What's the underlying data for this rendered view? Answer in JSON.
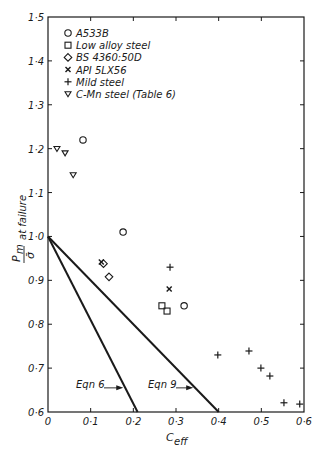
{
  "chart_data": {
    "type": "scatter",
    "title": "",
    "xlabel": "C_eff",
    "ylabel": "P_m/σ̄ at failure",
    "xlim": [
      0,
      0.6
    ],
    "ylim": [
      0.6,
      1.5
    ],
    "x_ticks": [
      "0",
      "0·1",
      "0·2",
      "0·3",
      "0·4",
      "0·5",
      "0·6"
    ],
    "x_tick_values": [
      0,
      0.1,
      0.2,
      0.3,
      0.4,
      0.5,
      0.6
    ],
    "y_ticks": [
      "0·6",
      "0·7",
      "0·8",
      "0·9",
      "1·0",
      "1·1",
      "1·2",
      "1·3",
      "1·4",
      "1·5"
    ],
    "y_tick_values": [
      0.6,
      0.7,
      0.8,
      0.9,
      1.0,
      1.1,
      1.2,
      1.3,
      1.4,
      1.5
    ],
    "grid": false,
    "legend_position": "upper-left",
    "series": [
      {
        "name": "A533B",
        "marker": "circle",
        "points": [
          [
            0.082,
            1.22
          ],
          [
            0.176,
            1.01
          ],
          [
            0.319,
            0.842
          ]
        ]
      },
      {
        "name": "Low alloy steel",
        "marker": "square",
        "points": [
          [
            0.267,
            0.842
          ],
          [
            0.279,
            0.83
          ]
        ]
      },
      {
        "name": "BS 4360:50D",
        "marker": "diamond",
        "points": [
          [
            0.13,
            0.938
          ],
          [
            0.143,
            0.908
          ]
        ]
      },
      {
        "name": "API 5LX56",
        "marker": "x",
        "points": [
          [
            0.125,
            0.942
          ],
          [
            0.284,
            0.88
          ]
        ]
      },
      {
        "name": "Mild steel",
        "marker": "plus",
        "points": [
          [
            0.286,
            0.93
          ],
          [
            0.398,
            0.73
          ],
          [
            0.471,
            0.739
          ],
          [
            0.499,
            0.7
          ],
          [
            0.52,
            0.682
          ],
          [
            0.553,
            0.621
          ],
          [
            0.59,
            0.618
          ]
        ]
      },
      {
        "name": "C-Mn steel (Table 6)",
        "marker": "triangle-down",
        "points": [
          [
            0.021,
            1.2
          ],
          [
            0.04,
            1.19
          ],
          [
            0.059,
            1.14
          ]
        ]
      }
    ],
    "lines": [
      {
        "name": "Eqn 6",
        "from": [
          0,
          1.0
        ],
        "to": [
          0.21,
          0.6
        ],
        "label": "Eqn 6",
        "label_at": [
          0.135,
          0.655
        ]
      },
      {
        "name": "Eqn 9",
        "from": [
          0,
          1.0
        ],
        "to": [
          0.4,
          0.6
        ],
        "label": "Eqn 9",
        "label_at": [
          0.3,
          0.655
        ]
      }
    ]
  },
  "legend": {
    "items": [
      "A533B",
      "Low alloy steel",
      "BS 4360:50D",
      "API 5LX56",
      "Mild steel",
      "C-Mn steel (Table 6)"
    ]
  },
  "labels": {
    "ylabel_main": "P",
    "ylabel_sub": "m",
    "ylabel_den": "σ̄",
    "ylabel_rest": "at failure",
    "xlabel_main": "C",
    "xlabel_sub": "eff",
    "eqn6": "Eqn 6",
    "eqn9": "Eqn 9"
  }
}
